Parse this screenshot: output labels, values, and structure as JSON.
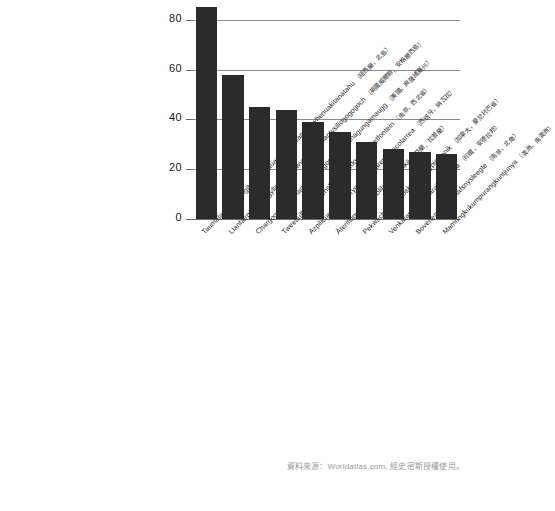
{
  "chart_data": {
    "type": "bar",
    "title": "",
    "subtitle": "",
    "xlabel": "",
    "ylabel": "",
    "ylim": [
      0,
      88
    ],
    "yticks": [
      0,
      20,
      40,
      60,
      80
    ],
    "grid": true,
    "gridlines_at": [
      20,
      40,
      60,
      80
    ],
    "legend": "none",
    "bar_color": "#2b2b2b",
    "categories": [
      "Taumatawhakatangihangakoauauotamateapokaiwhenuakitanatahu",
      "Llanfairpwllgwyngyllgogerychwyrndrobwillantysiliogogogoch",
      "Chargoggagoggmanchauggagoggchaubunagungamaugg",
      "Tweebuffelsmeteenskootmorsdoodgeskietfontein",
      "Azpilicuetagaracoryocosaroyarenberecolarrea",
      "Äteritsiputeritsipuolilautatsijänkä",
      "Pekwachnamaykoskwaskwaypinwanik",
      "Venkatanarasimharajuvaripeta",
      "Bovenendvankeelafsnysleegte",
      "Mamungkukumpurangkuntjunya"
    ],
    "category_annotations": [
      "（紐西蘭，北島）",
      "（英國威爾斯，安格爾西島）",
      "（美國，麻薩諸塞州）",
      "（南非，西北省）",
      "（西班牙，納瓦拉）",
      "（芬蘭，拉普蘭）",
      "（加拿大，曼尼托巴省）",
      "（印度，安德拉邦）",
      "（南非，北角）",
      "（澳洲，南澳洲）"
    ],
    "values": [
      85,
      58,
      45,
      44,
      39,
      35,
      31,
      28,
      27,
      26
    ],
    "value_unit": "letters"
  },
  "source": {
    "text": "資料來源：Worldatlas.com, 經史密斯授權使用。"
  }
}
